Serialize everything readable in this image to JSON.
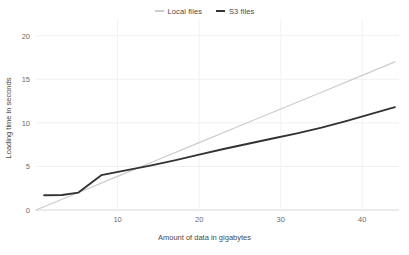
{
  "chart_data": {
    "type": "line",
    "title": "",
    "xlabel": "Amount of data in gigabytes",
    "ylabel": "Loading time in seconds",
    "xlim": [
      0,
      44.5
    ],
    "ylim": [
      0,
      21
    ],
    "xticks": [
      10,
      20,
      30,
      40
    ],
    "yticks": [
      0,
      5,
      10,
      15,
      20
    ],
    "xtick_labels": [
      "10",
      "20",
      "30",
      "40"
    ],
    "ytick_labels": [
      "0",
      "5",
      "10",
      "15",
      "20"
    ],
    "grid": true,
    "legend_position": "top-center",
    "series": [
      {
        "name": "Local files",
        "color": "#cccccc",
        "x": [
          0,
          5,
          10,
          15,
          20,
          25,
          30,
          35,
          40,
          44
        ],
        "values": [
          0.0,
          1.93,
          3.86,
          5.8,
          7.73,
          9.66,
          11.59,
          13.52,
          15.45,
          17.0
        ]
      },
      {
        "name": "S3 files",
        "color": "#333333",
        "x": [
          1,
          3.2,
          5.2,
          8.0,
          11.0,
          14.0,
          17.0,
          20.0,
          23.0,
          26.0,
          29.0,
          32.0,
          35.0,
          38.0,
          41.0,
          44.0
        ],
        "values": [
          1.7,
          1.72,
          2.0,
          4.0,
          4.55,
          5.1,
          5.7,
          6.35,
          7.0,
          7.6,
          8.2,
          8.8,
          9.45,
          10.2,
          11.0,
          11.8
        ]
      }
    ]
  },
  "legend": {
    "entries": [
      {
        "label": "Local files",
        "color": "#cccccc"
      },
      {
        "label": "S3 files",
        "color": "#333333"
      }
    ]
  },
  "axes": {
    "x_title": "Amount of data in gigabytes",
    "y_title": "Loading time in seconds"
  }
}
